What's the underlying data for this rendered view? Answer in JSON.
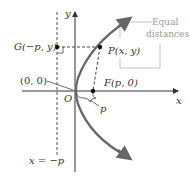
{
  "diagram": {
    "axes": {
      "x_label": "x",
      "y_label": "y"
    },
    "origin_label": "O",
    "origin_coord_label": "(0, 0)",
    "point_G_label": "G(−p, y)",
    "point_P_label": "P(x, y)",
    "focus_label": "F(p, 0)",
    "distance_label": "p",
    "directrix_label": "x = −p",
    "annotation": {
      "line1": "Equal",
      "line2": "distances"
    },
    "colors": {
      "curve": "#555555",
      "axes": "#333333",
      "dashed": "#444444",
      "annotation": "#aaaaaa"
    }
  }
}
